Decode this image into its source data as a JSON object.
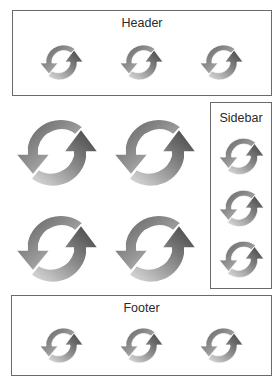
{
  "header": {
    "label": "Header",
    "icons": [
      "refresh-icon",
      "refresh-icon",
      "refresh-icon"
    ]
  },
  "main": {
    "icons": [
      "refresh-icon",
      "refresh-icon",
      "refresh-icon",
      "refresh-icon"
    ]
  },
  "sidebar": {
    "label": "Sidebar",
    "icons": [
      "refresh-icon",
      "refresh-icon",
      "refresh-icon"
    ]
  },
  "footer": {
    "label": "Footer",
    "icons": [
      "refresh-icon",
      "refresh-icon",
      "refresh-icon"
    ]
  },
  "colors": {
    "border": "#6a6a6a",
    "arrow_dark": "#4a4a4a",
    "arrow_light": "#cfcfcf",
    "text": "#2a2a2a"
  }
}
